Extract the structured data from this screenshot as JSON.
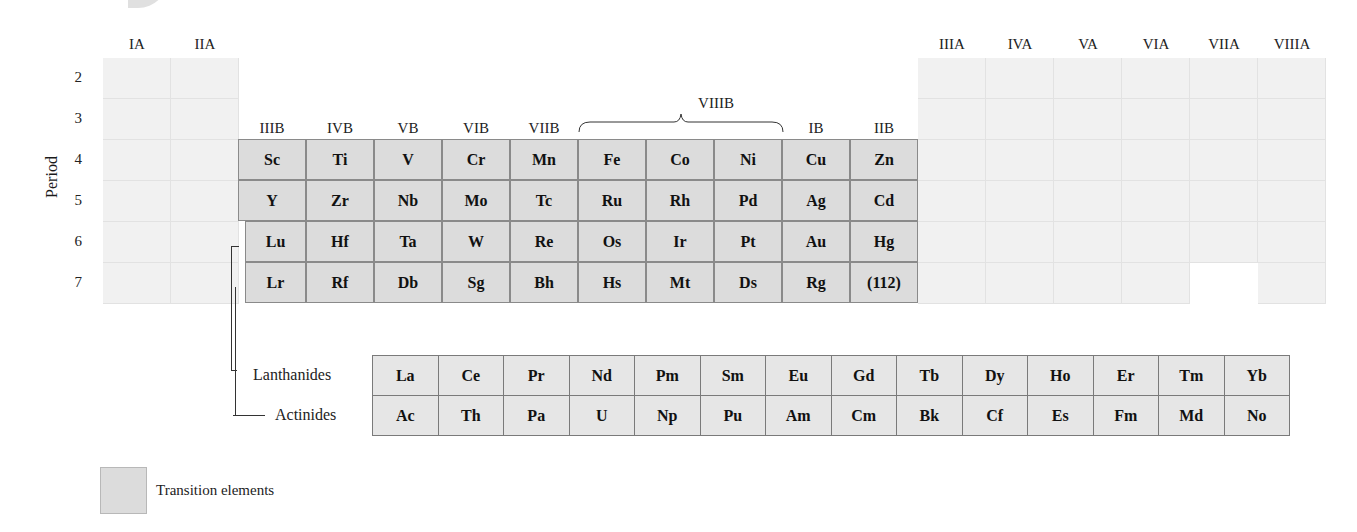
{
  "group_labels_a_left": [
    "IA",
    "IIA"
  ],
  "group_labels_b": [
    "IIIB",
    "IVB",
    "VB",
    "VIB",
    "VIIB",
    "",
    "",
    "",
    "IB",
    "IIB"
  ],
  "group_label_viiib": "VIIIB",
  "group_labels_a_right": [
    "IIIA",
    "IVA",
    "VA",
    "VIA",
    "VIIA",
    "VIIIA"
  ],
  "axis_label": "Period",
  "periods": [
    "2",
    "3",
    "4",
    "5",
    "6",
    "7"
  ],
  "transition_rows": [
    [
      "Sc",
      "Ti",
      "V",
      "Cr",
      "Mn",
      "Fe",
      "Co",
      "Ni",
      "Cu",
      "Zn"
    ],
    [
      "Y",
      "Zr",
      "Nb",
      "Mo",
      "Tc",
      "Ru",
      "Rh",
      "Pd",
      "Ag",
      "Cd"
    ],
    [
      "Lu",
      "Hf",
      "Ta",
      "W",
      "Re",
      "Os",
      "Ir",
      "Pt",
      "Au",
      "Hg"
    ],
    [
      "Lr",
      "Rf",
      "Db",
      "Sg",
      "Bh",
      "Hs",
      "Mt",
      "Ds",
      "Rg",
      "(112)"
    ]
  ],
  "f_block": {
    "lanthanides_label": "Lanthanides",
    "actinides_label": "Actinides",
    "lanthanides": [
      "La",
      "Ce",
      "Pr",
      "Nd",
      "Pm",
      "Sm",
      "Eu",
      "Gd",
      "Tb",
      "Dy",
      "Ho",
      "Er",
      "Tm",
      "Yb"
    ],
    "actinides": [
      "Ac",
      "Th",
      "Pa",
      "U",
      "Np",
      "Pu",
      "Am",
      "Cm",
      "Bk",
      "Cf",
      "Es",
      "Fm",
      "Md",
      "No"
    ]
  },
  "legend": {
    "label": "Transition elements",
    "color": "#dcdcdc"
  },
  "colors": {
    "transition": "#dcdcdc",
    "other": "#f1f1f1",
    "f_block": "#e6e6e6"
  }
}
